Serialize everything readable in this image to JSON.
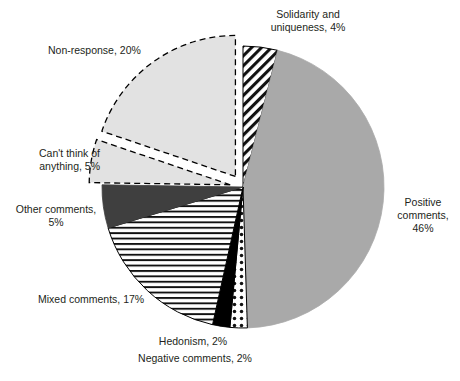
{
  "chart_data": {
    "type": "pie",
    "title": "",
    "subtitle": "",
    "xlabel": "",
    "ylabel": "",
    "grid": false,
    "legend_position": "none",
    "label_format": "{name}, {value}%",
    "start_angle_deg": 0,
    "direction": "clockwise",
    "total": 101,
    "categories": [
      "Solidarity and uniqueness",
      "Positive comments",
      "Negative comments",
      "Hedonism",
      "Mixed comments",
      "Other comments",
      "Can't think of anything",
      "Non-response"
    ],
    "values": [
      4,
      46,
      2,
      2,
      17,
      5,
      5,
      20
    ],
    "slices": [
      {
        "name": "Solidarity and uniqueness",
        "value": 4,
        "label": "Solidarity and\nuniqueness, 4%",
        "fill": "diagonal-hatch",
        "fill_color": "#ffffff",
        "stroke": "#000000",
        "exploded": false
      },
      {
        "name": "Positive comments",
        "value": 46,
        "label": "Positive\ncomments,\n46%",
        "fill": "solid",
        "fill_color": "#a9a9a9",
        "stroke": "#a9a9a9",
        "exploded": false
      },
      {
        "name": "Negative comments",
        "value": 2,
        "label": "Negative comments, 2%",
        "fill": "dots",
        "fill_color": "#ffffff",
        "stroke": "#000000",
        "exploded": false
      },
      {
        "name": "Hedonism",
        "value": 2,
        "label": "Hedonism, 2%",
        "fill": "solid",
        "fill_color": "#000000",
        "stroke": "#000000",
        "exploded": false
      },
      {
        "name": "Mixed comments",
        "value": 17,
        "label": "Mixed comments, 17%",
        "fill": "horizontal-stripes",
        "fill_color": "#ffffff",
        "stroke": "#000000",
        "exploded": false
      },
      {
        "name": "Other comments",
        "value": 5,
        "label": "Other comments,\n5%",
        "fill": "solid",
        "fill_color": "#3f3f3f",
        "stroke": "#3f3f3f",
        "exploded": false
      },
      {
        "name": "Can't think of anything",
        "value": 5,
        "label": "Can't think of\nanything, 5%",
        "fill": "solid",
        "fill_color": "#e2e2e2",
        "stroke": "#000000",
        "stroke_dashed": true,
        "exploded": true
      },
      {
        "name": "Non-response",
        "value": 20,
        "label": "Non-response, 20%",
        "fill": "solid",
        "fill_color": "#e2e2e2",
        "stroke": "#000000",
        "stroke_dashed": true,
        "exploded": true
      }
    ]
  },
  "labels": {
    "solidarity": "Solidarity and\nuniqueness, 4%",
    "nonresponse": "Non-response, 20%",
    "cant_think": "Can't think of\nanything, 5%",
    "other": "Other comments,\n5%",
    "mixed": "Mixed comments, 17%",
    "hedonism": "Hedonism, 2%",
    "negative": "Negative comments, 2%",
    "positive": "Positive\ncomments,\n46%"
  },
  "colors": {
    "positive_gray": "#a9a9a9",
    "other_dark_gray": "#3f3f3f",
    "exploded_light_gray": "#e2e2e2",
    "black": "#000000",
    "white": "#ffffff",
    "text": "#231f20"
  }
}
